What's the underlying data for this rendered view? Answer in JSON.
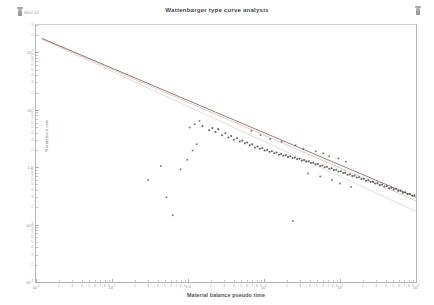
{
  "header": {
    "title": "Wattenbarger type curve analysis",
    "left_badge_label": "Well 01",
    "left_badge_icon": "pin-icon",
    "right_badge_icon": "pin-icon"
  },
  "chart_data": {
    "type": "scatter",
    "title": "Wattenbarger type curve analysis",
    "xlabel": "Material balance pseudo time",
    "ylabel": "Normalized rate",
    "xscale": "log",
    "yscale": "log",
    "grid": false,
    "legend": "none",
    "xlim": [
      0.01,
      1000
    ],
    "ylim": [
      0.01,
      300
    ],
    "x_decade_labels": [
      "10<sup>-2</sup>",
      "10<sup>-1</sup>",
      "1.0",
      "10<sup>1</sup>",
      "10<sup>2</sup>",
      "10<sup>3</sup>"
    ],
    "y_decade_labels": [
      "10<sup>2</sup>",
      "10<sup>1</sup>",
      "1.0",
      "10<sup>-1</sup>",
      "10<sup>-2</sup>"
    ],
    "minor_tick_labels": [
      "2",
      "3",
      "4",
      "5",
      "6",
      "7",
      "8",
      "9"
    ],
    "series": [
      {
        "name": "data-points",
        "type": "scatter",
        "color": "#4c4c4c",
        "marker": "circle",
        "points": [
          [
            1.55,
            5.2
          ],
          [
            1.9,
            4.4
          ],
          [
            2.1,
            4.8
          ],
          [
            2.3,
            4.1
          ],
          [
            2.5,
            4.6
          ],
          [
            2.8,
            3.6
          ],
          [
            3.1,
            3.9
          ],
          [
            3.4,
            3.3
          ],
          [
            3.7,
            3.5
          ],
          [
            4.0,
            3.0
          ],
          [
            4.4,
            3.2
          ],
          [
            4.8,
            2.8
          ],
          [
            5.2,
            2.9
          ],
          [
            5.6,
            2.6
          ],
          [
            6.0,
            2.7
          ],
          [
            6.5,
            2.4
          ],
          [
            7.0,
            2.5
          ],
          [
            7.6,
            2.2
          ],
          [
            8.2,
            2.3
          ],
          [
            8.8,
            2.1
          ],
          [
            9.5,
            2.15
          ],
          [
            10.2,
            1.95
          ],
          [
            11.0,
            2.0
          ],
          [
            11.8,
            1.85
          ],
          [
            12.7,
            1.9
          ],
          [
            13.6,
            1.75
          ],
          [
            14.6,
            1.8
          ],
          [
            15.7,
            1.65
          ],
          [
            16.8,
            1.7
          ],
          [
            18.0,
            1.58
          ],
          [
            19.3,
            1.62
          ],
          [
            20.7,
            1.5
          ],
          [
            22.2,
            1.55
          ],
          [
            23.8,
            1.44
          ],
          [
            25.5,
            1.47
          ],
          [
            27.3,
            1.38
          ],
          [
            29.3,
            1.4
          ],
          [
            31.4,
            1.3
          ],
          [
            33.7,
            1.33
          ],
          [
            36.1,
            1.25
          ],
          [
            38.7,
            1.27
          ],
          [
            41.5,
            1.18
          ],
          [
            44.5,
            1.2
          ],
          [
            47.7,
            1.12
          ],
          [
            51.1,
            1.14
          ],
          [
            54.8,
            1.05
          ],
          [
            58.7,
            1.07
          ],
          [
            63.0,
            1.0
          ],
          [
            67.5,
            1.02
          ],
          [
            72.4,
            0.94
          ],
          [
            77.6,
            0.96
          ],
          [
            83.2,
            0.89
          ],
          [
            89.2,
            0.9
          ],
          [
            95.6,
            0.84
          ],
          [
            102.5,
            0.85
          ],
          [
            110.0,
            0.79
          ],
          [
            117.0,
            0.8
          ],
          [
            126.0,
            0.74
          ],
          [
            135.0,
            0.75
          ],
          [
            145.0,
            0.7
          ],
          [
            155.0,
            0.71
          ],
          [
            166.0,
            0.66
          ],
          [
            178.0,
            0.67
          ],
          [
            191.0,
            0.62
          ],
          [
            205.0,
            0.63
          ],
          [
            220.0,
            0.58
          ],
          [
            236.0,
            0.59
          ],
          [
            253.0,
            0.55
          ],
          [
            271.0,
            0.56
          ],
          [
            291.0,
            0.52
          ],
          [
            312.0,
            0.53
          ],
          [
            334.0,
            0.49
          ],
          [
            358.0,
            0.5
          ],
          [
            384.0,
            0.46
          ],
          [
            412.0,
            0.47
          ],
          [
            442.0,
            0.43
          ],
          [
            474.0,
            0.44
          ],
          [
            508.0,
            0.41
          ],
          [
            545.0,
            0.42
          ],
          [
            584.0,
            0.385
          ],
          [
            627.0,
            0.39
          ],
          [
            672.0,
            0.36
          ],
          [
            721.0,
            0.365
          ],
          [
            773.0,
            0.34
          ],
          [
            829.0,
            0.345
          ],
          [
            889.0,
            0.32
          ],
          [
            953.0,
            0.325
          ]
        ],
        "outliers": [
          [
            0.3,
            0.6
          ],
          [
            0.44,
            1.05
          ],
          [
            0.52,
            0.3
          ],
          [
            0.63,
            0.145
          ],
          [
            0.8,
            0.92
          ],
          [
            0.98,
            1.35
          ],
          [
            1.15,
            1.95
          ],
          [
            1.3,
            2.5
          ],
          [
            1.42,
            6.4
          ],
          [
            1.05,
            4.9
          ],
          [
            1.22,
            5.6
          ],
          [
            6.8,
            4.3
          ],
          [
            9.0,
            3.6
          ],
          [
            12.0,
            3.1
          ],
          [
            17.0,
            2.8
          ],
          [
            26.0,
            2.4
          ],
          [
            33.0,
            2.1
          ],
          [
            48.0,
            1.9
          ],
          [
            60.0,
            1.75
          ],
          [
            72.0,
            1.55
          ],
          [
            95.0,
            1.42
          ],
          [
            120.0,
            1.25
          ],
          [
            38.0,
            0.78
          ],
          [
            55.0,
            0.69
          ],
          [
            78.0,
            0.6
          ],
          [
            100.0,
            0.52
          ],
          [
            140.0,
            0.45
          ],
          [
            24.0,
            0.115
          ]
        ]
      },
      {
        "name": "type-curve-upper",
        "type": "line",
        "color": "#8a6b63",
        "comment": "main model curve from top-left to bottom-right"
      },
      {
        "name": "type-curve-lower",
        "type": "line",
        "color": "#c9c0bd",
        "comment": "lower bound type curve"
      },
      {
        "name": "type-curve-middle",
        "type": "line",
        "color": "#d8d2d0",
        "comment": "intermediate type curve"
      }
    ]
  }
}
